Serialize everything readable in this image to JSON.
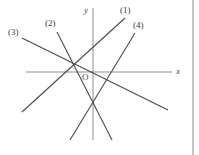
{
  "figure": {
    "background_color": "#ffffff",
    "line_color": "#4a4a4a",
    "axis_color": "#8d8d8d",
    "border_color": "#8a8a8a",
    "axes": {
      "x_label": "x",
      "y_label": "y",
      "origin_label": "O",
      "x_axis": {
        "x1": 26,
        "y1": 72,
        "x2": 172,
        "y2": 72
      },
      "y_axis": {
        "x1": 93,
        "y1": 8,
        "x2": 93,
        "y2": 140
      }
    },
    "border": {
      "x1": 193,
      "y1": 0,
      "x2": 193,
      "y2": 155
    },
    "lines": [
      {
        "name": "line-1",
        "label": "(1)",
        "x1": 125,
        "y1": 18,
        "x2": 22,
        "y2": 112,
        "slope_sign": "positive"
      },
      {
        "name": "line-2",
        "label": "(2)",
        "x1": 57,
        "y1": 32,
        "x2": 112,
        "y2": 140,
        "slope_sign": "negative"
      },
      {
        "name": "line-3",
        "label": "(3)",
        "x1": 22,
        "y1": 38,
        "x2": 168,
        "y2": 110,
        "slope_sign": "negative"
      },
      {
        "name": "line-4",
        "label": "(4)",
        "x1": 135,
        "y1": 33,
        "x2": 70,
        "y2": 140,
        "slope_sign": "positive"
      }
    ]
  }
}
